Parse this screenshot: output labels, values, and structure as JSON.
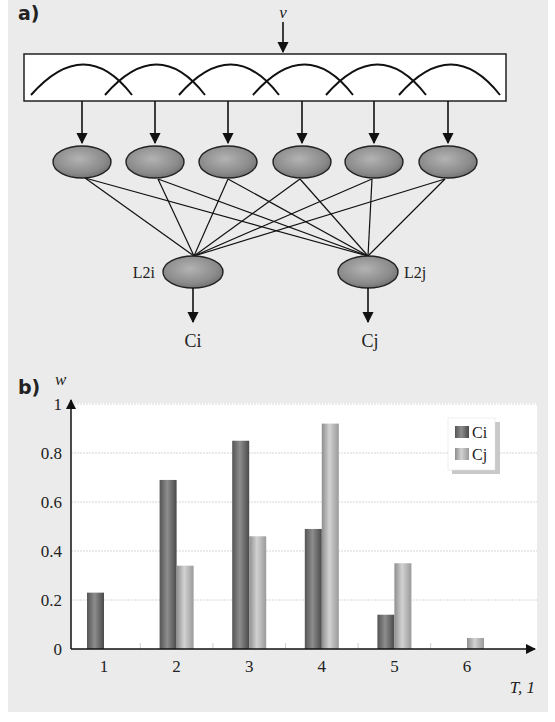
{
  "panel_a": {
    "label": "a)",
    "input_label": "v",
    "layer1_count": 6,
    "layer2": [
      {
        "node_label": "L2i",
        "output_label": "Ci"
      },
      {
        "node_label": "L2j",
        "output_label": "Cj"
      }
    ]
  },
  "panel_b": {
    "label": "b)"
  },
  "chart_data": {
    "type": "bar",
    "title": "",
    "xlabel": "T, 1",
    "ylabel": "w",
    "categories": [
      "1",
      "2",
      "3",
      "4",
      "5",
      "6"
    ],
    "series": [
      {
        "name": "Ci",
        "values": [
          0.23,
          0.69,
          0.85,
          0.49,
          0.14,
          0.0
        ]
      },
      {
        "name": "Cj",
        "values": [
          0.0,
          0.34,
          0.46,
          0.92,
          0.35,
          0.045
        ]
      }
    ],
    "yticks": [
      "0",
      "0.2",
      "0.4",
      "0.6",
      "0.8",
      "1"
    ],
    "ylim": [
      0,
      1
    ],
    "grid": true,
    "legend_position": "top-right"
  },
  "colors": {
    "background": "#ebebeb",
    "plot_bg": "#ffffff",
    "ci_bar": "#6f6f6f",
    "cj_bar": "#b5b5b5",
    "node_fill": "#8c8c8c"
  }
}
